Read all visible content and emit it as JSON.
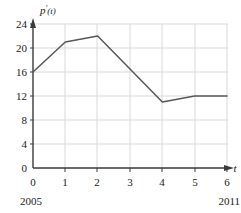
{
  "chart_data": {
    "type": "line",
    "title": "",
    "xlabel": "t",
    "ylabel": "p'(t)",
    "x": [
      0,
      1,
      2,
      4,
      5,
      6
    ],
    "values": [
      16,
      21,
      22,
      11,
      12,
      12
    ],
    "series": [
      {
        "name": "p'(t)",
        "x": [
          0,
          1,
          2,
          4,
          5,
          6
        ],
        "values": [
          16,
          21,
          22,
          11,
          12,
          12
        ]
      }
    ],
    "xlim": [
      0,
      6
    ],
    "ylim": [
      0,
      24
    ],
    "xticks": [
      "0",
      "1",
      "2",
      "3",
      "4",
      "5",
      "6"
    ],
    "yticks": [
      "0",
      "4",
      "8",
      "12",
      "16",
      "20",
      "24"
    ],
    "grid": true,
    "legend": false,
    "annotations": {
      "x_start_year": "2005",
      "x_end_year": "2011"
    },
    "colors": {
      "curve": "#585858",
      "grid": "#d9d9d9",
      "axis": "#3a3a3a",
      "background": "#ffffff"
    }
  },
  "axes": {
    "y_axis_label_base": "p",
    "y_axis_label_prime": "′",
    "y_axis_label_arg": "(t)",
    "x_axis_label": "t"
  },
  "yticks": [
    {
      "label": "24"
    },
    {
      "label": "20"
    },
    {
      "label": "16"
    },
    {
      "label": "12"
    },
    {
      "label": "8"
    },
    {
      "label": "4"
    },
    {
      "label": "0"
    }
  ],
  "xticks": [
    {
      "label": "0"
    },
    {
      "label": "1"
    },
    {
      "label": "2"
    },
    {
      "label": "3"
    },
    {
      "label": "4"
    },
    {
      "label": "5"
    },
    {
      "label": "6"
    }
  ],
  "years": {
    "start": "2005",
    "end": "2011"
  }
}
